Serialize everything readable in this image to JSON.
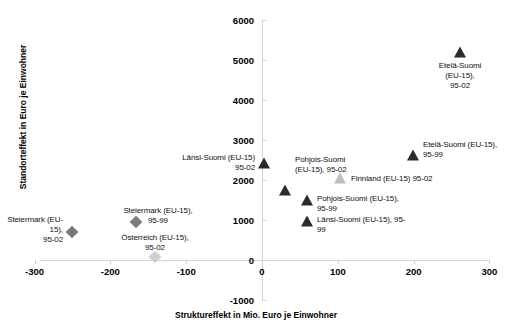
{
  "chart_data": {
    "type": "scatter",
    "title": "",
    "xlabel": "Struktureffekt in Mio. Euro je Einwohner",
    "ylabel": "Standorteffekt in Euro je Einwohner",
    "xlim": [
      -300,
      300
    ],
    "ylim": [
      -1000,
      6000
    ],
    "xticks": [
      -300,
      -200,
      -100,
      0,
      100,
      200,
      300
    ],
    "yticks": [
      -1000,
      0,
      1000,
      2000,
      3000,
      4000,
      5000,
      6000
    ],
    "xtick_labels": [
      "-300",
      "-200",
      "-100",
      "0",
      "100",
      "200",
      "300"
    ],
    "ytick_labels": [
      "-1000",
      "0",
      "1000",
      "2000",
      "3000",
      "4000",
      "5000",
      "6000"
    ],
    "grid": false,
    "legend": "none",
    "points": [
      {
        "id": "etela-suomi-95-02",
        "label": "Etelä-Suomi (EU-15),\n95-02",
        "x": 262,
        "y": 5300,
        "marker": "triangle",
        "color": "#2b2b2b",
        "px": 460,
        "py": 52,
        "label_px": 460,
        "label_py": 61,
        "label_pos": "center"
      },
      {
        "id": "etela-suomi-95-99",
        "label": "Etelä-Suomi (EU-15),\n95-99",
        "x": 200,
        "y": 2650,
        "marker": "triangle",
        "color": "#2b2b2b",
        "px": 413,
        "py": 155,
        "label_px": 423,
        "label_py": 140,
        "label_pos": "right"
      },
      {
        "id": "lansi-suomi-95-02",
        "label": "Länsi-Suomi (EU-15)\n95-02",
        "x": 3,
        "y": 2400,
        "marker": "triangle",
        "color": "#2b2b2b",
        "px": 264,
        "py": 163,
        "label_px": 255,
        "label_py": 153,
        "label_pos": "left"
      },
      {
        "id": "pohjois-suomi-95-02",
        "label": "Pohjois-Suomi\n(EU-15), 95-02",
        "x": 30,
        "y": 1900,
        "marker": "triangle",
        "color": "#2b2b2b",
        "px": 285,
        "py": 190,
        "label_px": 295,
        "label_py": 155,
        "label_pos": "right"
      },
      {
        "id": "finnland-95-02",
        "label": "Finnland (EU-15) 95-02",
        "x": 103,
        "y": 1850,
        "marker": "triangle",
        "color": "#bfbfbf",
        "px": 340,
        "py": 178,
        "label_px": 351,
        "label_py": 174,
        "label_pos": "right"
      },
      {
        "id": "pohjois-suomi-95-99",
        "label": "Pohjois-Suomi (EU-15),\n95-99",
        "x": 60,
        "y": 1400,
        "marker": "triangle",
        "color": "#2b2b2b",
        "px": 307,
        "py": 200,
        "label_px": 317,
        "label_py": 194,
        "label_pos": "right"
      },
      {
        "id": "lansi-suomi-95-99",
        "label": "Länsi-Suomi (EU-15), 95-\n99",
        "x": 60,
        "y": 900,
        "marker": "triangle",
        "color": "#2b2b2b",
        "px": 307,
        "py": 221,
        "label_px": 317,
        "label_py": 215,
        "label_pos": "right"
      },
      {
        "id": "steiermark-95-02",
        "label": "Steiermark (EU-15),\n95-02",
        "x": -252,
        "y": 800,
        "marker": "diamond",
        "color": "#7a7a7a",
        "px": 72,
        "py": 232,
        "label_px": 63,
        "label_py": 215,
        "label_pos": "left"
      },
      {
        "id": "steiermark-95-99",
        "label": "Steiermark (EU-15),\n95-99",
        "x": -168,
        "y": 1000,
        "marker": "diamond",
        "color": "#7a7a7a",
        "px": 136,
        "py": 222,
        "label_px": 158,
        "label_py": 206,
        "label_pos": "center"
      },
      {
        "id": "osterreich-95-02",
        "label": "Österreich (EU-15),\n95-02",
        "x": -142,
        "y": 120,
        "marker": "diamond",
        "color": "#cfcfcf",
        "px": 155,
        "py": 257,
        "label_px": 155,
        "label_py": 233,
        "label_pos": "center"
      }
    ]
  },
  "colors": {
    "marker_dark": "#2b2b2b",
    "marker_mid": "#7a7a7a",
    "marker_light": "#cfcfcf",
    "axis": "#d4d4d4",
    "text": "#000000"
  }
}
